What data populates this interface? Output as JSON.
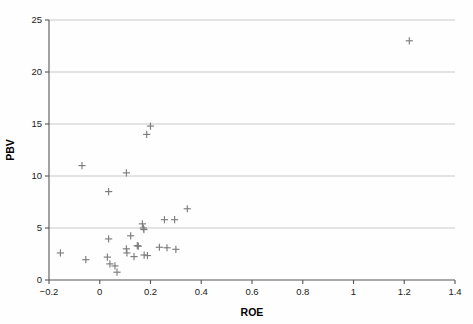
{
  "chart_data": {
    "type": "scatter",
    "title": "",
    "xlabel": "ROE",
    "ylabel": "PBV",
    "xlim": [
      -0.2,
      1.4
    ],
    "ylim": [
      0,
      25
    ],
    "xticks": [
      -0.2,
      0,
      0.2,
      0.4,
      0.6,
      0.8,
      1,
      1.2,
      1.4
    ],
    "xtick_labels": [
      "−0.2",
      "0",
      "0.2",
      "0.4",
      "0.6",
      "0.8",
      "1",
      "1.2",
      "1.4"
    ],
    "yticks": [
      0,
      5,
      10,
      15,
      20,
      25
    ],
    "ytick_labels": [
      "0",
      "5",
      "10",
      "15",
      "20",
      "25"
    ],
    "grid": "horizontal",
    "legend": "none",
    "marker": "plus",
    "marker_color": "#7d7d7d",
    "points": [
      {
        "x": -0.155,
        "y": 2.6
      },
      {
        "x": -0.07,
        "y": 11.0
      },
      {
        "x": -0.055,
        "y": 1.95
      },
      {
        "x": 0.03,
        "y": 2.2
      },
      {
        "x": 0.035,
        "y": 8.5
      },
      {
        "x": 0.035,
        "y": 3.95
      },
      {
        "x": 0.04,
        "y": 1.55
      },
      {
        "x": 0.06,
        "y": 1.35
      },
      {
        "x": 0.068,
        "y": 0.75
      },
      {
        "x": 0.105,
        "y": 10.3
      },
      {
        "x": 0.105,
        "y": 3.0
      },
      {
        "x": 0.107,
        "y": 2.6
      },
      {
        "x": 0.122,
        "y": 4.25
      },
      {
        "x": 0.135,
        "y": 2.25
      },
      {
        "x": 0.148,
        "y": 3.3
      },
      {
        "x": 0.152,
        "y": 3.25
      },
      {
        "x": 0.168,
        "y": 5.4
      },
      {
        "x": 0.172,
        "y": 5.0
      },
      {
        "x": 0.174,
        "y": 4.85
      },
      {
        "x": 0.175,
        "y": 2.4
      },
      {
        "x": 0.185,
        "y": 14.0
      },
      {
        "x": 0.188,
        "y": 2.35
      },
      {
        "x": 0.2,
        "y": 14.8
      },
      {
        "x": 0.235,
        "y": 3.15
      },
      {
        "x": 0.255,
        "y": 5.8
      },
      {
        "x": 0.265,
        "y": 3.1
      },
      {
        "x": 0.295,
        "y": 5.8
      },
      {
        "x": 0.3,
        "y": 2.95
      },
      {
        "x": 0.345,
        "y": 6.85
      },
      {
        "x": 1.22,
        "y": 23.0
      }
    ]
  },
  "style": {
    "grid_color": "#c9c9c9",
    "axis_color": "#555555",
    "text_color": "#1a1a1a"
  }
}
